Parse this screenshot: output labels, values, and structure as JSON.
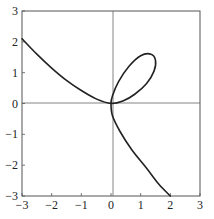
{
  "chart_data": {
    "type": "line",
    "title": "",
    "xlabel": "",
    "ylabel": "",
    "xlim": [
      -3,
      3
    ],
    "ylim": [
      -3,
      3
    ],
    "grid": false,
    "axes_through_origin": true,
    "x_ticks": [
      "-3",
      "-2",
      "-1",
      "0",
      "1",
      "2",
      "3"
    ],
    "y_ticks": [
      "-3",
      "-2",
      "-1",
      "0",
      "1",
      "2",
      "3"
    ],
    "series": [
      {
        "name": "curve",
        "description": "Parametric curve with a loop in the first quadrant; upper-left branch from (-3, 2.1) to origin, loop reaching about (1.5, 1.6), lower branch from origin to (2, -3)",
        "points": [
          [
            -3.0,
            2.1
          ],
          [
            -2.5,
            1.6
          ],
          [
            -2.0,
            1.15
          ],
          [
            -1.5,
            0.75
          ],
          [
            -1.0,
            0.42
          ],
          [
            -0.5,
            0.15
          ],
          [
            0.0,
            0.0
          ],
          [
            0.4,
            0.08
          ],
          [
            0.8,
            0.3
          ],
          [
            1.2,
            0.65
          ],
          [
            1.45,
            1.05
          ],
          [
            1.5,
            1.4
          ],
          [
            1.35,
            1.6
          ],
          [
            1.0,
            1.55
          ],
          [
            0.6,
            1.2
          ],
          [
            0.25,
            0.7
          ],
          [
            0.05,
            0.25
          ],
          [
            0.0,
            0.0
          ],
          [
            0.05,
            -0.4
          ],
          [
            0.3,
            -0.9
          ],
          [
            0.7,
            -1.5
          ],
          [
            1.2,
            -2.1
          ],
          [
            1.6,
            -2.6
          ],
          [
            2.0,
            -3.0
          ]
        ]
      }
    ],
    "colors": {
      "curve": "#222222",
      "frame": "#555555",
      "axes": "#666666"
    }
  }
}
